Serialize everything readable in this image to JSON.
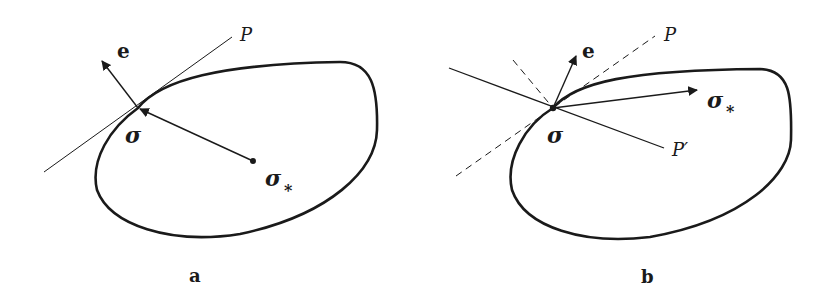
{
  "figure": {
    "panels": [
      {
        "id": "a",
        "caption": "a",
        "labels": {
          "normal": "e",
          "tangent_plane": "P",
          "point": "σ",
          "target_point": "σ",
          "target_subscript": "*"
        }
      },
      {
        "id": "b",
        "caption": "b",
        "labels": {
          "normal": "e",
          "tangent_plane": "P",
          "other_plane": "P′",
          "point": "σ",
          "target_point": "σ",
          "target_subscript": "*"
        }
      }
    ],
    "colors": {
      "stroke": "#1a1a1a",
      "background": "#ffffff"
    }
  }
}
